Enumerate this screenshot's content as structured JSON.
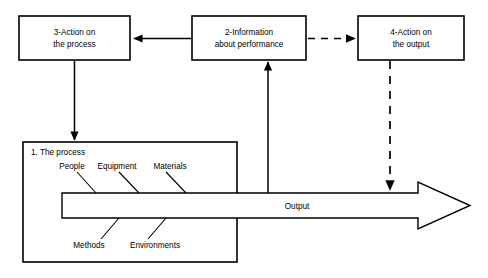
{
  "diagram": {
    "type": "process-feedback-loop-diagram",
    "background_color": "#ffffff",
    "line_color": "#000000",
    "boxes": [
      {
        "id": "box-action-process",
        "number": "3",
        "line1": "3-Action on",
        "line2": "the process"
      },
      {
        "id": "box-information",
        "number": "2",
        "line1": "2-Information",
        "line2": "about performance"
      },
      {
        "id": "box-action-output",
        "number": "4",
        "line1": "4-Action on",
        "line2": "the output"
      }
    ],
    "process": {
      "title": "1. The process",
      "factors_top": [
        "People",
        "Equipment",
        "Materials"
      ],
      "factors_bottom": [
        "Methods",
        "Environments"
      ]
    },
    "output": {
      "label": "Output"
    },
    "connectors": [
      {
        "id": "information-to-action-process",
        "style": "solid",
        "direction": "left"
      },
      {
        "id": "information-to-action-output",
        "style": "dashed",
        "direction": "right"
      },
      {
        "id": "action-process-to-process",
        "style": "solid",
        "direction": "down"
      },
      {
        "id": "output-to-information",
        "style": "solid",
        "direction": "up"
      },
      {
        "id": "action-output-to-output",
        "style": "dashed",
        "direction": "down"
      }
    ]
  }
}
